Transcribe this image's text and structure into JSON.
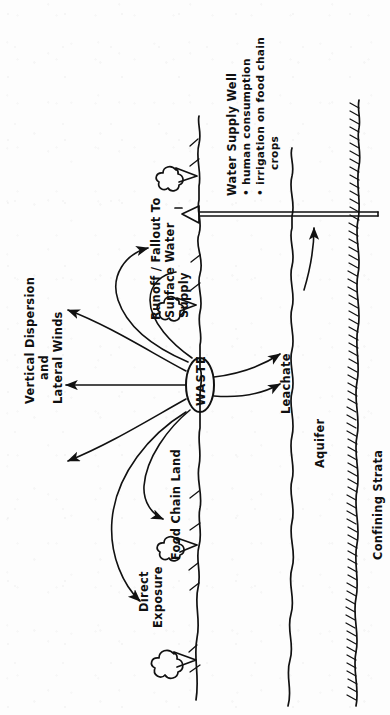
{
  "figure": {
    "orientation_note": "All labels rendered rotated 90 degrees (reading bottom-to-top), as in the scanned page.",
    "ink_color": "#111111",
    "background_color": "#fdfdfd"
  },
  "labels": {
    "vertical_dispersion": "Vertical  Dispersion",
    "and": "and",
    "lateral_winds": "Lateral  Winds",
    "direct_exposure_line1": "Direct",
    "direct_exposure_line2": "Exposure",
    "food_chain_land": "Food  Chain  Land",
    "runoff_line1": "Runoff / Fallout  To",
    "runoff_line2": "Surface  Water",
    "runoff_line3": "Supply",
    "waste": "WASTE",
    "leachate": "Leachate",
    "aquifer": "Aquifer",
    "confining_strata": "Confining  Strata",
    "water_supply_well": "Water  Supply  Well",
    "bullet_human_consumption": "• human consumption",
    "bullet_irrigation_line1": "• irrigation on food  chain",
    "bullet_irrigation_line2": "crops"
  },
  "elements": {
    "waste_ellipse": "waste-source-ellipse",
    "ground_surface": "ground-surface-line",
    "water_table": "water-table-line",
    "confining_layer": "confining-strata-hatched-line",
    "well_pipe": "water-supply-well-pipe",
    "well_head": "well-head-triangle",
    "trees": [
      "tree-top",
      "tree-middle",
      "tree-lower",
      "tree-bottom"
    ],
    "arrows": [
      "air-dispersion-arrow-upper",
      "air-dispersion-arrow-middle",
      "air-dispersion-arrow-lower",
      "runoff-surface-water-arrow",
      "food-chain-land-arrow",
      "direct-exposure-arrow",
      "leachate-arrow-upper",
      "leachate-arrow-lower",
      "groundwater-flow-arrow"
    ]
  }
}
